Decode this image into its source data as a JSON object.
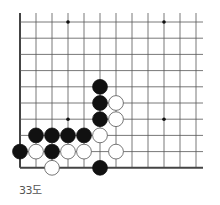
{
  "diagram": {
    "caption": "33도",
    "board": {
      "columns": 12,
      "rows": 10,
      "origin_x": 20,
      "origin_y": 22,
      "spacing_x": 16,
      "spacing_y": 16.2,
      "line_extend_right": 203,
      "line_extend_top": 13,
      "edges": [
        "left",
        "bottom"
      ],
      "line_color": "#555555",
      "edge_color": "#444444"
    },
    "star_points": [
      {
        "col": 3,
        "row": 0
      },
      {
        "col": 9,
        "row": 0
      },
      {
        "col": 3,
        "row": 6
      },
      {
        "col": 9,
        "row": 6
      }
    ],
    "stones": [
      {
        "color": "black",
        "col": 5,
        "row": 4
      },
      {
        "color": "black",
        "col": 5,
        "row": 5
      },
      {
        "color": "white",
        "col": 6,
        "row": 5
      },
      {
        "color": "black",
        "col": 5,
        "row": 6
      },
      {
        "color": "white",
        "col": 6,
        "row": 6
      },
      {
        "color": "black",
        "col": 1,
        "row": 7
      },
      {
        "color": "black",
        "col": 2,
        "row": 7
      },
      {
        "color": "black",
        "col": 3,
        "row": 7
      },
      {
        "color": "black",
        "col": 4,
        "row": 7
      },
      {
        "color": "white",
        "col": 5,
        "row": 7
      },
      {
        "color": "black",
        "col": 0,
        "row": 8
      },
      {
        "color": "white",
        "col": 1,
        "row": 8
      },
      {
        "color": "black",
        "col": 2,
        "row": 8
      },
      {
        "color": "white",
        "col": 3,
        "row": 8
      },
      {
        "color": "white",
        "col": 4,
        "row": 8
      },
      {
        "color": "white",
        "col": 6,
        "row": 8
      },
      {
        "color": "white",
        "col": 2,
        "row": 9
      },
      {
        "color": "black",
        "col": 5,
        "row": 9
      }
    ]
  }
}
